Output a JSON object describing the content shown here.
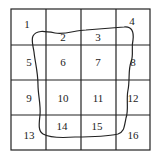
{
  "grid": {
    "rows": 4,
    "cols": 4,
    "cells": [
      {
        "label": "1",
        "x": 27,
        "y": 28
      },
      {
        "label": "2",
        "x": 63,
        "y": 41
      },
      {
        "label": "3",
        "x": 98,
        "y": 41
      },
      {
        "label": "4",
        "x": 132,
        "y": 25
      },
      {
        "label": "5",
        "x": 29,
        "y": 66
      },
      {
        "label": "6",
        "x": 63,
        "y": 66
      },
      {
        "label": "7",
        "x": 98,
        "y": 66
      },
      {
        "label": "8",
        "x": 133,
        "y": 66
      },
      {
        "label": "9",
        "x": 29,
        "y": 102
      },
      {
        "label": "10",
        "x": 63,
        "y": 102
      },
      {
        "label": "11",
        "x": 98,
        "y": 102
      },
      {
        "label": "12",
        "x": 133,
        "y": 102
      },
      {
        "label": "13",
        "x": 29,
        "y": 139
      },
      {
        "label": "14",
        "x": 62,
        "y": 130
      },
      {
        "label": "15",
        "x": 97,
        "y": 130
      },
      {
        "label": "16",
        "x": 133,
        "y": 139
      }
    ]
  },
  "colors": {
    "line": "#222222",
    "background": "#ffffff"
  }
}
